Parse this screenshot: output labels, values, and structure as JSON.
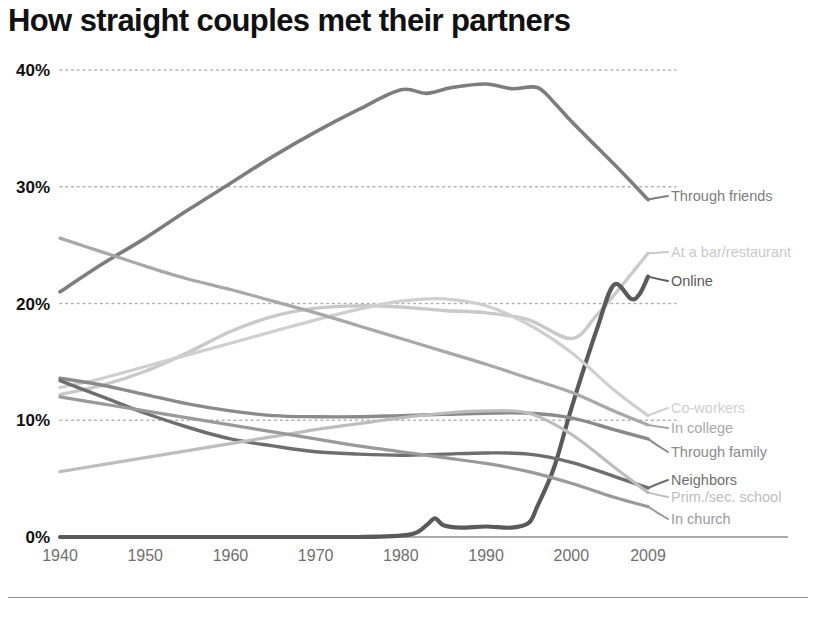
{
  "chart_data": {
    "type": "line",
    "title": "How straight couples met their partners",
    "xlabel": "",
    "ylabel": "",
    "xlim": [
      1940,
      2009
    ],
    "ylim": [
      0,
      40
    ],
    "grid": true,
    "legend_position": "right-inline-labels",
    "x_tick_labels": [
      "1940",
      "1950",
      "1960",
      "1970",
      "1980",
      "1990",
      "2000",
      "2009"
    ],
    "x_ticks": [
      1940,
      1950,
      1960,
      1970,
      1980,
      1990,
      2000,
      2009
    ],
    "y_tick_labels": [
      "0%",
      "10%",
      "20%",
      "30%",
      "40%"
    ],
    "y_ticks": [
      0,
      10,
      20,
      30,
      40
    ],
    "series": [
      {
        "name": "Through friends",
        "color": "#7d7d7d",
        "width": 3.6,
        "label_y": 196,
        "x": [
          1940,
          1945,
          1950,
          1955,
          1960,
          1965,
          1970,
          1975,
          1980,
          1983,
          1986,
          1990,
          1993,
          1996,
          1998,
          2000,
          2003,
          2006,
          2009
        ],
        "values": [
          21.0,
          23.4,
          25.6,
          28.0,
          30.3,
          32.6,
          34.7,
          36.6,
          38.3,
          38.0,
          38.5,
          38.8,
          38.4,
          38.5,
          37.2,
          35.6,
          33.4,
          31.2,
          28.9
        ]
      },
      {
        "name": "At a bar/restaurant",
        "color": "#c9c9c9",
        "width": 3.4,
        "label_y": 252,
        "x": [
          1940,
          1945,
          1950,
          1955,
          1960,
          1965,
          1970,
          1975,
          1980,
          1985,
          1990,
          1995,
          2000,
          2003,
          2006,
          2009
        ],
        "values": [
          12.2,
          13.0,
          14.2,
          15.8,
          17.6,
          18.9,
          19.6,
          19.8,
          19.7,
          19.4,
          19.2,
          18.6,
          17.0,
          19.0,
          21.6,
          24.3
        ]
      },
      {
        "name": "Online",
        "color": "#5a5a5a",
        "width": 4.2,
        "label_y": 281,
        "x": [
          1940,
          1960,
          1975,
          1981,
          1983,
          1984,
          1985,
          1987,
          1990,
          1993,
          1995,
          1996,
          1998,
          2000,
          2003,
          2005,
          2007,
          2008,
          2009
        ],
        "values": [
          0.0,
          0.0,
          0.0,
          0.2,
          1.0,
          1.6,
          1.0,
          0.8,
          0.9,
          0.8,
          1.2,
          2.6,
          6.0,
          11.0,
          17.8,
          21.6,
          20.4,
          20.8,
          22.3
        ]
      },
      {
        "name": "Co-workers",
        "color": "#cfcfcf",
        "width": 3.2,
        "label_y": 408,
        "x": [
          1940,
          1945,
          1950,
          1955,
          1960,
          1965,
          1970,
          1975,
          1980,
          1985,
          1990,
          1995,
          2000,
          2005,
          2009
        ],
        "values": [
          12.8,
          13.6,
          14.6,
          15.6,
          16.6,
          17.6,
          18.6,
          19.5,
          20.2,
          20.4,
          19.8,
          18.2,
          15.8,
          12.6,
          10.4
        ]
      },
      {
        "name": "In college",
        "color": "#a8a8a8",
        "width": 3.2,
        "label_y": 428,
        "x": [
          1940,
          1945,
          1950,
          1955,
          1960,
          1965,
          1970,
          1975,
          1980,
          1985,
          1990,
          1995,
          2000,
          2005,
          2009
        ],
        "values": [
          25.6,
          24.4,
          23.2,
          22.1,
          21.2,
          20.2,
          19.2,
          18.1,
          17.0,
          15.9,
          14.8,
          13.6,
          12.4,
          10.8,
          9.6
        ]
      },
      {
        "name": "Through family",
        "color": "#8a8a8a",
        "width": 3.4,
        "label_y": 452,
        "x": [
          1940,
          1945,
          1950,
          1955,
          1960,
          1965,
          1970,
          1975,
          1980,
          1985,
          1990,
          1995,
          2000,
          2005,
          2009
        ],
        "values": [
          13.6,
          13.0,
          12.2,
          11.4,
          10.8,
          10.4,
          10.3,
          10.3,
          10.4,
          10.5,
          10.6,
          10.6,
          10.2,
          9.2,
          8.4
        ]
      },
      {
        "name": "Neighbors",
        "color": "#6e6e6e",
        "width": 3.4,
        "label_y": 480,
        "x": [
          1940,
          1945,
          1950,
          1955,
          1960,
          1965,
          1970,
          1975,
          1980,
          1985,
          1990,
          1995,
          2000,
          2005,
          2009
        ],
        "values": [
          13.4,
          12.0,
          10.6,
          9.4,
          8.4,
          7.8,
          7.3,
          7.1,
          7.0,
          7.1,
          7.2,
          7.1,
          6.4,
          5.2,
          4.2
        ]
      },
      {
        "name": "Prim./sec. school",
        "color": "#bdbdbd",
        "width": 3.2,
        "label_y": 497,
        "x": [
          1940,
          1945,
          1950,
          1955,
          1960,
          1965,
          1970,
          1975,
          1980,
          1985,
          1990,
          1995,
          2000,
          2005,
          2009
        ],
        "values": [
          5.6,
          6.2,
          6.8,
          7.4,
          8.0,
          8.6,
          9.2,
          9.7,
          10.2,
          10.6,
          10.8,
          10.6,
          8.8,
          6.0,
          3.8
        ]
      },
      {
        "name": "In church",
        "color": "#9a9a9a",
        "width": 3.2,
        "label_y": 519,
        "x": [
          1940,
          1945,
          1950,
          1955,
          1960,
          1965,
          1970,
          1975,
          1980,
          1985,
          1990,
          1995,
          2000,
          2005,
          2009
        ],
        "values": [
          12.0,
          11.4,
          10.8,
          10.2,
          9.6,
          9.0,
          8.4,
          7.8,
          7.3,
          6.8,
          6.3,
          5.6,
          4.6,
          3.4,
          2.6
        ]
      }
    ]
  },
  "footer": {
    "note": ""
  },
  "colors": {
    "grid": "#b0b0b0",
    "axis_text": "#6f6f6f",
    "title": "#111111",
    "baseline": "#8e8e8e"
  }
}
